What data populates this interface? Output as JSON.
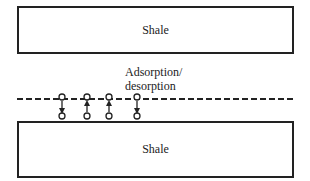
{
  "diagram": {
    "top_layer": {
      "label": "Shale"
    },
    "bottom_layer": {
      "label": "Shale"
    },
    "process_label": {
      "line1": "Adsorption/",
      "line2": "desorption"
    },
    "interface": {
      "style": "dashed",
      "color": "#222222"
    },
    "molecules": [
      {
        "x": 62,
        "direction": "down"
      },
      {
        "x": 87,
        "direction": "up"
      },
      {
        "x": 109,
        "direction": "up"
      },
      {
        "x": 137,
        "direction": "down"
      }
    ],
    "colors": {
      "line": "#222222",
      "background": "#ffffff"
    }
  }
}
